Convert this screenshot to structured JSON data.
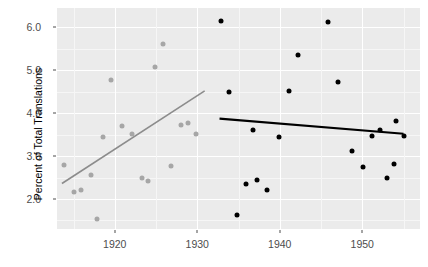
{
  "chart_data": {
    "type": "scatter",
    "title": "",
    "subtitle": "",
    "xlabel": "",
    "ylabel": "Percent of Total Translations",
    "xlim": [
      1913,
      1957
    ],
    "ylim": [
      1.3,
      6.45
    ],
    "x_ticks": [
      1920,
      1930,
      1940,
      1950
    ],
    "x_tick_labels": [
      "1920",
      "1930",
      "1940",
      "1950"
    ],
    "y_ticks": [
      2.0,
      3.0,
      4.0,
      5.0,
      6.0
    ],
    "y_tick_labels": [
      "2.0",
      "3.0",
      "4.0",
      "5.0",
      "6.0"
    ],
    "grid": true,
    "legend": "none",
    "panel_background": "#ebebeb",
    "gridline_color": "#ffffff",
    "series": [
      {
        "name": "early-period",
        "color": "#a6a6a6",
        "marker": "circle",
        "points": [
          {
            "x": 1913.8,
            "y": 2.79
          },
          {
            "x": 1915.1,
            "y": 2.16
          },
          {
            "x": 1915.9,
            "y": 2.22
          },
          {
            "x": 1917.1,
            "y": 2.55
          },
          {
            "x": 1917.9,
            "y": 1.53
          },
          {
            "x": 1918.6,
            "y": 3.45
          },
          {
            "x": 1919.6,
            "y": 4.77
          },
          {
            "x": 1920.9,
            "y": 3.71
          },
          {
            "x": 1922.1,
            "y": 3.52
          },
          {
            "x": 1923.3,
            "y": 2.5
          },
          {
            "x": 1924.0,
            "y": 2.41
          },
          {
            "x": 1924.9,
            "y": 5.07
          },
          {
            "x": 1925.9,
            "y": 5.61
          },
          {
            "x": 1926.8,
            "y": 2.77
          },
          {
            "x": 1928.0,
            "y": 3.73
          },
          {
            "x": 1928.9,
            "y": 3.78
          },
          {
            "x": 1929.9,
            "y": 3.52
          }
        ]
      },
      {
        "name": "late-period",
        "color": "#000000",
        "marker": "circle",
        "points": [
          {
            "x": 1932.9,
            "y": 6.15
          },
          {
            "x": 1933.9,
            "y": 4.5
          },
          {
            "x": 1934.8,
            "y": 1.63
          },
          {
            "x": 1935.9,
            "y": 2.36
          },
          {
            "x": 1936.8,
            "y": 3.6
          },
          {
            "x": 1937.3,
            "y": 2.45
          },
          {
            "x": 1938.5,
            "y": 2.2
          },
          {
            "x": 1939.9,
            "y": 3.45
          },
          {
            "x": 1941.1,
            "y": 4.51
          },
          {
            "x": 1942.2,
            "y": 5.36
          },
          {
            "x": 1945.9,
            "y": 6.12
          },
          {
            "x": 1947.0,
            "y": 4.72
          },
          {
            "x": 1948.7,
            "y": 3.12
          },
          {
            "x": 1950.1,
            "y": 2.74
          },
          {
            "x": 1951.2,
            "y": 3.47
          },
          {
            "x": 1952.1,
            "y": 3.61
          },
          {
            "x": 1953.0,
            "y": 2.5
          },
          {
            "x": 1953.8,
            "y": 2.82
          },
          {
            "x": 1954.1,
            "y": 3.82
          },
          {
            "x": 1955.0,
            "y": 3.47
          }
        ]
      }
    ],
    "trend_lines": [
      {
        "name": "early-trend",
        "color": "#8c8c8c",
        "width": 1.6,
        "x0": 1913.6,
        "y0": 2.36,
        "x1": 1930.9,
        "y1": 4.52
      },
      {
        "name": "late-trend",
        "color": "#000000",
        "width": 2.2,
        "x0": 1932.7,
        "y0": 3.87,
        "x1": 1955.0,
        "y1": 3.52
      }
    ]
  }
}
